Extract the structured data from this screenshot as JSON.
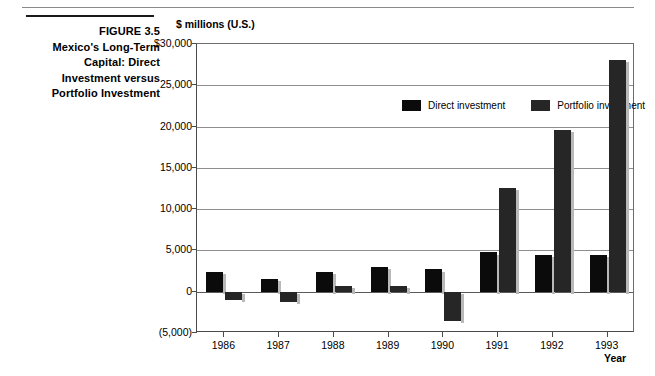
{
  "figure": {
    "number_label": "FIGURE 3.5",
    "title_lines": [
      "FIGURE 3.5",
      "Mexico's Long-Term",
      "Capital: Direct",
      "Investment versus",
      "Portfolio Investment"
    ]
  },
  "colors": {
    "direct": "#0b0b0b",
    "portfolio": "#262626",
    "gridline": "#8e8e8e",
    "axis": "#4a4a4a",
    "bar_shadow": "#b9b9b9",
    "background": "#ffffff"
  },
  "chart_data": {
    "type": "bar",
    "title": "",
    "subtitle": "",
    "unit_label": "$ millions (U.S.)",
    "xlabel": "Year",
    "ylabel": "$ millions (U.S.)",
    "categories": [
      "1986",
      "1987",
      "1988",
      "1989",
      "1990",
      "1991",
      "1992",
      "1993"
    ],
    "series": [
      {
        "name": "Direct investment",
        "color": "#0b0b0b",
        "values": [
          2400,
          1600,
          2400,
          3000,
          2700,
          4800,
          4500,
          4500
        ]
      },
      {
        "name": "Portfolio investment",
        "color": "#262626",
        "values": [
          -1000,
          -1200,
          700,
          700,
          -3500,
          12600,
          19600,
          28100
        ]
      }
    ],
    "ylim": [
      -5000,
      30000
    ],
    "ytick_values": [
      30000,
      25000,
      20000,
      15000,
      10000,
      5000,
      0,
      -5000
    ],
    "ytick_labels": [
      "$30,000",
      "25,000",
      "20,000",
      "15,000",
      "10,000",
      "5,000",
      "0",
      "(5,000)"
    ],
    "grid": true,
    "grid_axis": "y",
    "legend_position": "top-left",
    "legend_entries": [
      "Direct investment",
      "Portfolio investment"
    ]
  }
}
